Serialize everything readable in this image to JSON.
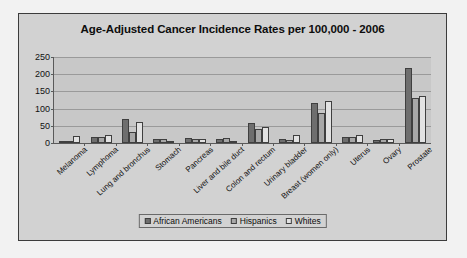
{
  "chart_data": {
    "type": "bar",
    "title": "Age-Adjusted Cancer Incidence Rates per 100,000 - 2006",
    "xlabel": "",
    "ylabel": "",
    "ylim": [
      0,
      250
    ],
    "yticks": [
      0,
      50,
      100,
      150,
      200,
      250
    ],
    "grid": true,
    "legend_position": "bottom",
    "categories": [
      "Melanoma",
      "Lymphoma",
      "Lung and bronchus",
      "Stomach",
      "Pancreas",
      "Liver and bile duct",
      "Colon and rectum",
      "Urinary bladder",
      "Breast (women only)",
      "Uterus",
      "Ovary",
      "Prostate"
    ],
    "series": [
      {
        "name": "African Americans",
        "color": "#6e6e6e",
        "values": [
          1,
          17,
          70,
          12,
          15,
          11,
          58,
          12,
          115,
          18,
          9,
          218
        ]
      },
      {
        "name": "Hispanics",
        "color": "#a8a8a8",
        "values": [
          4,
          18,
          32,
          13,
          13,
          14,
          42,
          10,
          88,
          17,
          11,
          132
        ]
      },
      {
        "name": "Whites",
        "color": "#e2e2e2",
        "values": [
          20,
          24,
          62,
          7,
          12,
          6,
          48,
          22,
          121,
          24,
          13,
          138
        ]
      }
    ]
  },
  "legend": {
    "items": [
      {
        "label": "African Americans"
      },
      {
        "label": "Hispanics"
      },
      {
        "label": "Whites"
      }
    ]
  }
}
